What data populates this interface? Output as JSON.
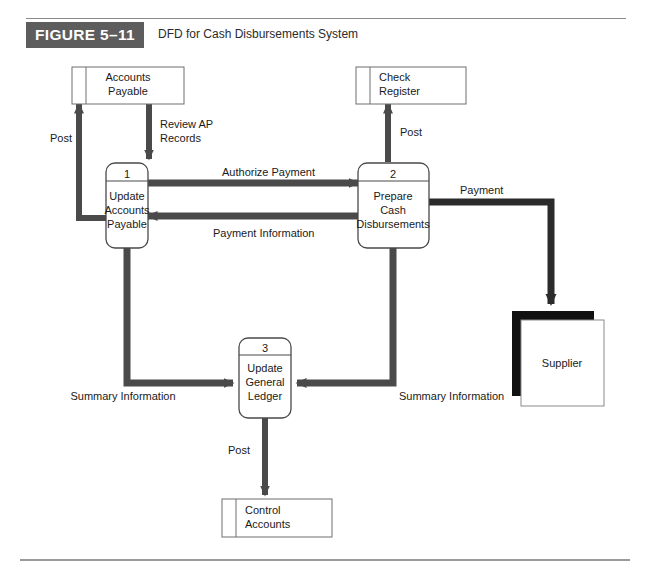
{
  "figure": {
    "badge": "FIGURE 5–11",
    "caption": "DFD for Cash Disbursements System"
  },
  "diagram": {
    "type": "data-flow-diagram",
    "processes": [
      {
        "id": "p1",
        "number": "1",
        "line1": "Update",
        "line2": "Accounts",
        "line3": "Payable"
      },
      {
        "id": "p2",
        "number": "2",
        "line1": "Prepare",
        "line2": "Cash",
        "line3": "Disbursements"
      },
      {
        "id": "p3",
        "number": "3",
        "line1": "Update",
        "line2": "General",
        "line3": "Ledger"
      }
    ],
    "data_stores": [
      {
        "id": "ds1",
        "line1": "Accounts",
        "line2": "Payable"
      },
      {
        "id": "ds2",
        "line1": "Check",
        "line2": "Register"
      },
      {
        "id": "ds3",
        "line1": "Control",
        "line2": "Accounts"
      }
    ],
    "entities": [
      {
        "id": "e1",
        "label": "Supplier"
      }
    ],
    "flows": [
      {
        "id": "f1",
        "label": "Post",
        "from": "p1",
        "to": "ds1"
      },
      {
        "id": "f2",
        "label": "Review AP\nRecords",
        "from": "ds1",
        "to": "p1",
        "line1": "Review AP",
        "line2": "Records"
      },
      {
        "id": "f3",
        "label": "Authorize Payment",
        "from": "p1",
        "to": "p2"
      },
      {
        "id": "f4",
        "label": "Payment Information",
        "from": "p2",
        "to": "p1"
      },
      {
        "id": "f5",
        "label": "Post",
        "from": "p2",
        "to": "ds2"
      },
      {
        "id": "f6",
        "label": "Payment",
        "from": "p2",
        "to": "e1"
      },
      {
        "id": "f7",
        "label": "Summary Information",
        "from": "p1",
        "to": "p3"
      },
      {
        "id": "f8",
        "label": "Summary Information",
        "from": "p2",
        "to": "p3"
      },
      {
        "id": "f9",
        "label": "Post",
        "from": "p3",
        "to": "ds3"
      }
    ]
  },
  "colors": {
    "badge_bg": "#5d5d5d",
    "flow_arrow": "#4a4a4a",
    "payment_arrow": "#2b2b2b",
    "entity_shadow": "#111111",
    "store_border": "#6e6e6e",
    "rule": "#8a8a8a"
  }
}
